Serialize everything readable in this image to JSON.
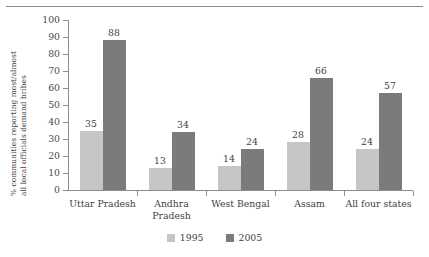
{
  "chart_data": {
    "type": "bar",
    "title": "",
    "xlabel": "",
    "ylabel_line1": "% communities reporting most/almost",
    "ylabel_line2": "all local officials demand bribes",
    "categories": [
      "Uttar Pradesh",
      "Andhra Pradesh",
      "West Bengal",
      "Assam",
      "All four states"
    ],
    "category_lines": [
      [
        "Uttar Pradesh"
      ],
      [
        "Andhra",
        "Pradesh"
      ],
      [
        "West Bengal"
      ],
      [
        "Assam"
      ],
      [
        "All four states"
      ]
    ],
    "series": [
      {
        "name": "1995",
        "color": "#c6c6c6",
        "values": [
          35,
          13,
          14,
          28,
          24
        ]
      },
      {
        "name": "2005",
        "color": "#7b7b7b",
        "values": [
          88,
          34,
          24,
          66,
          57
        ]
      }
    ],
    "ylim": [
      0,
      100
    ],
    "yticks": [
      0,
      10,
      20,
      30,
      40,
      50,
      60,
      70,
      80,
      90,
      100
    ],
    "ytick_labels": [
      "0",
      "10",
      "20",
      "30",
      "40",
      "50",
      "60",
      "70",
      "80",
      "90",
      "100"
    ],
    "grid": false,
    "legend_position": "bottom-center",
    "legend": [
      {
        "label": "1995",
        "color": "#c6c6c6"
      },
      {
        "label": "2005",
        "color": "#7b7b7b"
      }
    ]
  }
}
